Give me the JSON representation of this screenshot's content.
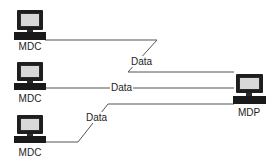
{
  "diagram": {
    "type": "network",
    "nodes": [
      {
        "id": "mdc1",
        "label": "MDC",
        "icon": "computer-icon"
      },
      {
        "id": "mdc2",
        "label": "MDC",
        "icon": "computer-icon"
      },
      {
        "id": "mdc3",
        "label": "MDC",
        "icon": "computer-icon"
      },
      {
        "id": "mdp",
        "label": "MDP",
        "icon": "computer-icon"
      }
    ],
    "edges": [
      {
        "from": "mdc1",
        "to": "mdp",
        "label": "Data"
      },
      {
        "from": "mdc2",
        "to": "mdp",
        "label": "Data"
      },
      {
        "from": "mdc3",
        "to": "mdp",
        "label": "Data"
      }
    ],
    "colors": {
      "line": "#555555",
      "device": "#1e1e1e",
      "screen": "#d8d8d8"
    }
  }
}
